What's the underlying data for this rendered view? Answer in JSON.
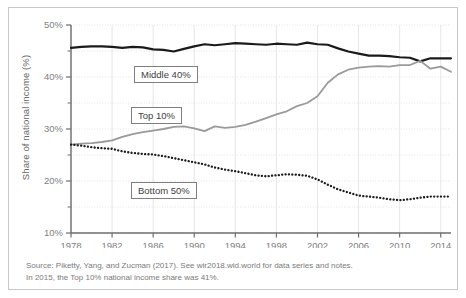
{
  "chart_data": {
    "type": "line",
    "title": "",
    "xlabel": "",
    "ylabel": "Share of national income (%)",
    "xlim": [
      1978,
      2015
    ],
    "ylim": [
      10,
      50
    ],
    "ytick_labels": [
      "50%",
      "40%",
      "30%",
      "20%",
      "10%"
    ],
    "ytick_values": [
      50,
      40,
      30,
      20,
      10
    ],
    "yminor_values": [
      45,
      35,
      25,
      15
    ],
    "xtick_labels": [
      "1978",
      "1982",
      "1986",
      "1990",
      "1994",
      "1998",
      "2002",
      "2006",
      "2010",
      "2014"
    ],
    "xtick_values": [
      1978,
      1982,
      1986,
      1990,
      1994,
      1998,
      2002,
      2006,
      2010,
      2014
    ],
    "grid": true,
    "legend_position": "inline-boxes",
    "x": [
      1978,
      1979,
      1980,
      1981,
      1982,
      1983,
      1984,
      1985,
      1986,
      1987,
      1988,
      1989,
      1990,
      1991,
      1992,
      1993,
      1994,
      1995,
      1996,
      1997,
      1998,
      1999,
      2000,
      2001,
      2002,
      2003,
      2004,
      2005,
      2006,
      2007,
      2008,
      2009,
      2010,
      2011,
      2012,
      2013,
      2014,
      2015
    ],
    "series": [
      {
        "name": "Middle 40%",
        "style": "solid",
        "color": "#1a1a1a",
        "values": [
          45.6,
          45.8,
          45.9,
          45.9,
          45.8,
          45.6,
          45.8,
          45.7,
          45.3,
          45.2,
          44.9,
          45.4,
          45.9,
          46.3,
          46.1,
          46.3,
          46.5,
          46.4,
          46.3,
          46.2,
          46.4,
          46.3,
          46.2,
          46.6,
          46.3,
          46.2,
          45.5,
          44.9,
          44.5,
          44.1,
          44.1,
          44.0,
          43.8,
          43.7,
          43.0,
          43.6,
          43.6,
          43.6
        ]
      },
      {
        "name": "Top 10%",
        "style": "solid",
        "color": "#9a9a9a",
        "values": [
          27.0,
          27.2,
          27.3,
          27.5,
          27.8,
          28.5,
          29.0,
          29.4,
          29.7,
          30.0,
          30.4,
          30.5,
          30.1,
          29.6,
          30.5,
          30.2,
          30.4,
          30.8,
          31.4,
          32.1,
          32.8,
          33.4,
          34.4,
          35.0,
          36.3,
          38.9,
          40.5,
          41.4,
          41.8,
          42.0,
          42.1,
          42.0,
          42.3,
          42.3,
          43.1,
          41.6,
          42.0,
          41.0
        ]
      },
      {
        "name": "Bottom 50%",
        "style": "dotted",
        "color": "#1a1a1a",
        "values": [
          27.0,
          26.8,
          26.5,
          26.3,
          26.2,
          25.7,
          25.4,
          25.2,
          25.1,
          24.8,
          24.4,
          24.0,
          23.6,
          23.2,
          22.6,
          22.2,
          21.9,
          21.5,
          21.1,
          20.9,
          21.1,
          21.3,
          21.2,
          21.0,
          20.3,
          19.3,
          18.4,
          17.8,
          17.2,
          17.0,
          16.8,
          16.5,
          16.3,
          16.5,
          16.8,
          17.0,
          17.0,
          17.0
        ]
      }
    ]
  },
  "axis": {
    "ylabel": "Share of national income (%)"
  },
  "legend": {
    "middle": "Middle 40%",
    "top": "Top 10%",
    "bottom": "Bottom 50%"
  },
  "source": {
    "line1": "Source: Piketty, Yang, and Zucman (2017). See wir2018.wid.world for data series and notes.",
    "line2": "In 2015, the Top 10% national income share was 41%."
  }
}
